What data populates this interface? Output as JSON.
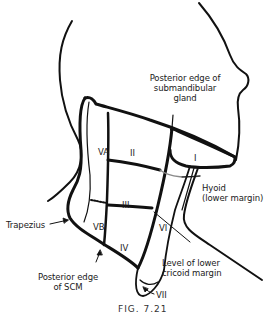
{
  "figure": {
    "caption": "FIG. 7.21",
    "colors": {
      "line": "#111111",
      "hyoid_line": "#8a8a8a",
      "background": "#ffffff"
    }
  },
  "levels": [
    {
      "id": "I",
      "label": "I"
    },
    {
      "id": "II",
      "label": "II"
    },
    {
      "id": "III",
      "label": "III"
    },
    {
      "id": "IV",
      "label": "IV"
    },
    {
      "id": "VA",
      "label": "VA"
    },
    {
      "id": "VB",
      "label": "VB"
    },
    {
      "id": "VI",
      "label": "VI"
    },
    {
      "id": "VII",
      "label": "VII"
    }
  ],
  "annotations": {
    "submandibular": {
      "line1": "Posterior edge of",
      "line2": "submandibular",
      "line3": "gland"
    },
    "hyoid": {
      "line1": "Hyoid",
      "line2": "(lower margin)"
    },
    "trapezius": {
      "line1": "Trapezius"
    },
    "cricoid": {
      "line1": "Level of lower",
      "line2": "cricoid margin"
    },
    "scm": {
      "line1": "Posterior edge",
      "line2": "of SCM"
    }
  }
}
